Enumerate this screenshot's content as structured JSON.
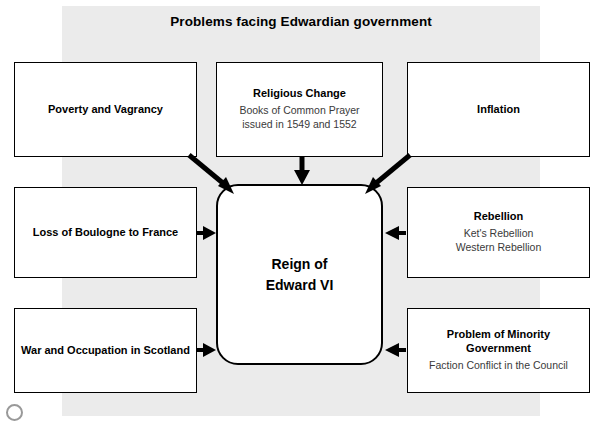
{
  "diagram": {
    "title": "Problems facing Edwardian government",
    "center": {
      "line1": "Reign of",
      "line2": "Edward VI"
    },
    "boxes": [
      {
        "id": "poverty",
        "heading": "Poverty and Vagrancy",
        "sub": ""
      },
      {
        "id": "religious-change",
        "heading": "Religious Change",
        "sub": "Books of Common Prayer issued in 1549 and 1552"
      },
      {
        "id": "inflation",
        "heading": "Inflation",
        "sub": ""
      },
      {
        "id": "loss-of-boulogne",
        "heading": "Loss of Boulogne to France",
        "sub": ""
      },
      {
        "id": "rebellion",
        "heading": "Rebellion",
        "sub": "Ket's Rebellion\nWestern Rebellion"
      },
      {
        "id": "war-scotland",
        "heading": "War and Occupation in Scotland",
        "sub": ""
      },
      {
        "id": "minority-government",
        "heading": "Problem of Minority Government",
        "sub": "Faction Conflict in the Council"
      }
    ],
    "colors": {
      "backdrop": "#ebebeb",
      "box_border": "#000000",
      "box_fill": "#ffffff",
      "heading_text": "#000000",
      "sub_text": "#3a3a3a"
    }
  }
}
